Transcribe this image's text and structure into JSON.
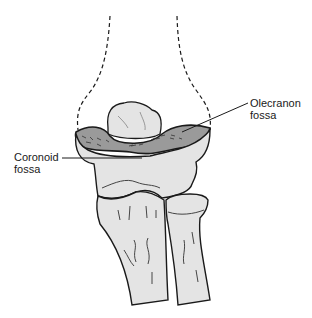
{
  "figure": {
    "colors": {
      "background": "#ffffff",
      "bone_fill": "#e4e4e4",
      "ink": "#1a1a1a",
      "cancellous": "#555555"
    }
  },
  "labels": {
    "olecranon": {
      "line1": "Olecranon",
      "line2": "fossa"
    },
    "coronoid": {
      "line1": "Coronoid",
      "line2": "fossa"
    }
  }
}
